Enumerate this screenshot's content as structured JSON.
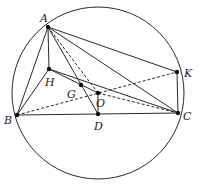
{
  "diagram": {
    "type": "geometry",
    "circle": {
      "cx": 98,
      "cy": 93,
      "r": 86
    },
    "points": {
      "A": {
        "label": "A",
        "x": 48,
        "y": 27,
        "lx": 40,
        "ly": 22
      },
      "H": {
        "label": "H",
        "x": 49,
        "y": 69,
        "lx": 45,
        "ly": 86
      },
      "G": {
        "label": "G",
        "x": 81,
        "y": 85,
        "lx": 67,
        "ly": 98
      },
      "O": {
        "label": "O",
        "x": 98,
        "y": 93,
        "lx": 96,
        "ly": 107
      },
      "D": {
        "label": "D",
        "x": 98,
        "y": 114,
        "lx": 94,
        "ly": 130
      },
      "B": {
        "label": "B",
        "x": 17,
        "y": 115,
        "lx": 4,
        "ly": 124
      },
      "C": {
        "label": "C",
        "x": 178,
        "y": 113,
        "lx": 183,
        "ly": 120
      },
      "K": {
        "label": "K",
        "x": 177,
        "y": 72,
        "lx": 184,
        "ly": 77
      }
    },
    "segments": [
      {
        "from": "A",
        "to": "B",
        "style": "solid"
      },
      {
        "from": "A",
        "to": "H",
        "style": "solid"
      },
      {
        "from": "A",
        "to": "D",
        "style": "solid"
      },
      {
        "from": "A",
        "to": "C",
        "style": "solid"
      },
      {
        "from": "A",
        "to": "K",
        "style": "solid"
      },
      {
        "from": "A",
        "to": "O",
        "style": "dashed"
      },
      {
        "from": "H",
        "to": "B",
        "style": "solid"
      },
      {
        "from": "H",
        "to": "C",
        "style": "solid"
      },
      {
        "from": "H",
        "to": "O",
        "style": "solid"
      },
      {
        "from": "B",
        "to": "C",
        "style": "solid"
      },
      {
        "from": "K",
        "to": "C",
        "style": "solid"
      },
      {
        "from": "D",
        "to": "O",
        "style": "solid"
      },
      {
        "from": "B",
        "to": "K",
        "style": "dashed"
      },
      {
        "from": "O",
        "to": "C",
        "style": "dashed"
      }
    ]
  }
}
